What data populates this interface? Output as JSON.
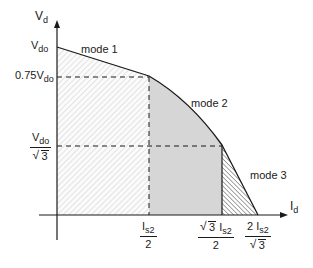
{
  "diagram": {
    "axes": {
      "y_label": {
        "main": "V",
        "sub": "d"
      },
      "x_label": {
        "main": "I",
        "sub": "d"
      }
    },
    "y_ticks": [
      {
        "id": "vdo",
        "main": "V",
        "sub": "do"
      },
      {
        "id": "075vdo",
        "prefix": "0.75V",
        "sub": "do"
      },
      {
        "id": "vdo_sqrt3",
        "num_main": "V",
        "num_sub": "do",
        "den_sqrt": "3"
      }
    ],
    "x_ticks": [
      {
        "id": "is2_half",
        "num_main": "I",
        "num_sub": "s2",
        "den": "2"
      },
      {
        "id": "sqrt3_is2_half",
        "num_sqrt": "3",
        "num_main": "I",
        "num_sub": "s2",
        "den": "2"
      },
      {
        "id": "two_is2_sqrt3",
        "num_prefix": "2 ",
        "num_main": "I",
        "num_sub": "s2",
        "den_sqrt": "3"
      }
    ],
    "regions": [
      {
        "name": "mode 1",
        "fill": "light diagonal hatch (\\)",
        "color": "#e8e8e8"
      },
      {
        "name": "mode 2",
        "fill": "solid grey",
        "color": "#d4d4d4"
      },
      {
        "name": "mode 3",
        "fill": "dense diagonal hatch (/)",
        "color": "#555555"
      }
    ],
    "mode_labels": [
      "mode 1",
      "mode 2",
      "mode 3"
    ],
    "colors": {
      "line": "#1a1a1a",
      "mode2_fill": "#d6d6d6",
      "mode1_hatch": "#d0d0d0",
      "mode3_hatch": "#4a4a4a"
    }
  }
}
